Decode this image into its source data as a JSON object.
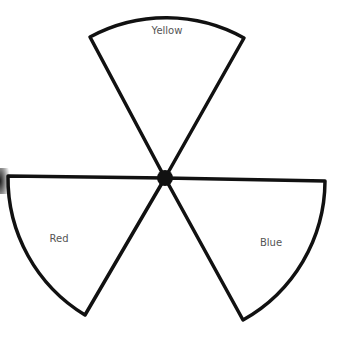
{
  "diagram": {
    "type": "three-sector spinner",
    "center": [
      165,
      178
    ],
    "radius": 160,
    "stroke_color": "#111111",
    "sectors": [
      {
        "label": "Yellow",
        "start_angle": -118,
        "end_angle": -62,
        "label_pos": [
          173,
          30
        ]
      },
      {
        "label": "Red",
        "start_angle": 178,
        "end_angle": 120,
        "label_pos": [
          59,
          238
        ]
      },
      {
        "label": "Blue",
        "start_angle": 2,
        "end_angle": 60,
        "label_pos": [
          271,
          242
        ]
      }
    ]
  }
}
